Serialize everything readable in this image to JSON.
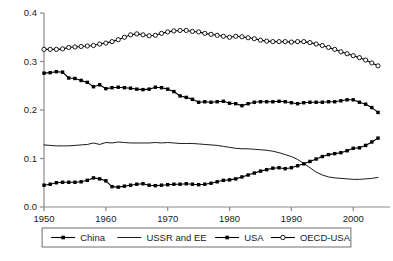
{
  "chart_data": {
    "type": "line",
    "title": "",
    "xlabel": "",
    "ylabel": "",
    "xlim": [
      1950,
      2004
    ],
    "ylim": [
      0.0,
      0.4
    ],
    "grid": false,
    "legend_position": "bottom",
    "yticks": [
      "0.0",
      "0.1",
      "0.2",
      "0.3",
      "0.4"
    ],
    "ytick_values": [
      0.0,
      0.1,
      0.2,
      0.3,
      0.4
    ],
    "xticks": [
      "1950",
      "1960",
      "1970",
      "1980",
      "1990",
      "2000"
    ],
    "xtick_values": [
      1950,
      1960,
      1970,
      1980,
      1990,
      2000
    ],
    "x": [
      1950,
      1951,
      1952,
      1953,
      1954,
      1955,
      1956,
      1957,
      1958,
      1959,
      1960,
      1961,
      1962,
      1963,
      1964,
      1965,
      1966,
      1967,
      1968,
      1969,
      1970,
      1971,
      1972,
      1973,
      1974,
      1975,
      1976,
      1977,
      1978,
      1979,
      1980,
      1981,
      1982,
      1983,
      1984,
      1985,
      1986,
      1987,
      1988,
      1989,
      1990,
      1991,
      1992,
      1993,
      1994,
      1995,
      1996,
      1997,
      1998,
      1999,
      2000,
      2001,
      2002,
      2003,
      2004
    ],
    "series": [
      {
        "name": "China",
        "marker": "filled-square",
        "line": "solid",
        "color": "#000000",
        "values": [
          0.045,
          0.047,
          0.05,
          0.051,
          0.051,
          0.051,
          0.052,
          0.055,
          0.06,
          0.058,
          0.054,
          0.042,
          0.041,
          0.043,
          0.045,
          0.047,
          0.048,
          0.045,
          0.044,
          0.045,
          0.046,
          0.047,
          0.047,
          0.048,
          0.047,
          0.046,
          0.047,
          0.049,
          0.052,
          0.055,
          0.056,
          0.058,
          0.062,
          0.066,
          0.07,
          0.074,
          0.077,
          0.08,
          0.081,
          0.079,
          0.081,
          0.085,
          0.089,
          0.094,
          0.099,
          0.104,
          0.108,
          0.11,
          0.112,
          0.116,
          0.121,
          0.122,
          0.127,
          0.134,
          0.142
        ]
      },
      {
        "name": "USSR and EE",
        "marker": "none",
        "line": "solid",
        "color": "#000000",
        "values": [
          0.128,
          0.127,
          0.126,
          0.126,
          0.126,
          0.127,
          0.128,
          0.129,
          0.132,
          0.129,
          0.133,
          0.132,
          0.134,
          0.133,
          0.132,
          0.132,
          0.132,
          0.132,
          0.133,
          0.132,
          0.133,
          0.132,
          0.131,
          0.131,
          0.131,
          0.13,
          0.129,
          0.128,
          0.127,
          0.125,
          0.123,
          0.121,
          0.12,
          0.12,
          0.119,
          0.118,
          0.117,
          0.115,
          0.112,
          0.108,
          0.104,
          0.098,
          0.09,
          0.081,
          0.072,
          0.066,
          0.062,
          0.06,
          0.059,
          0.058,
          0.057,
          0.057,
          0.058,
          0.059,
          0.061
        ]
      },
      {
        "name": "USA",
        "marker": "filled-square",
        "line": "solid",
        "color": "#000000",
        "values": [
          0.276,
          0.277,
          0.279,
          0.278,
          0.266,
          0.265,
          0.261,
          0.257,
          0.248,
          0.252,
          0.244,
          0.246,
          0.247,
          0.246,
          0.245,
          0.243,
          0.242,
          0.243,
          0.247,
          0.246,
          0.243,
          0.238,
          0.229,
          0.226,
          0.222,
          0.216,
          0.217,
          0.216,
          0.217,
          0.218,
          0.214,
          0.213,
          0.209,
          0.213,
          0.216,
          0.217,
          0.217,
          0.217,
          0.218,
          0.217,
          0.215,
          0.213,
          0.215,
          0.216,
          0.216,
          0.216,
          0.217,
          0.217,
          0.219,
          0.221,
          0.221,
          0.216,
          0.212,
          0.205,
          0.195
        ]
      },
      {
        "name": "OECD-USA",
        "marker": "open-circle",
        "line": "solid",
        "color": "#000000",
        "values": [
          0.325,
          0.325,
          0.325,
          0.326,
          0.329,
          0.33,
          0.331,
          0.332,
          0.333,
          0.336,
          0.338,
          0.341,
          0.345,
          0.35,
          0.355,
          0.357,
          0.355,
          0.353,
          0.354,
          0.358,
          0.361,
          0.363,
          0.364,
          0.364,
          0.362,
          0.361,
          0.358,
          0.356,
          0.354,
          0.352,
          0.35,
          0.352,
          0.351,
          0.349,
          0.347,
          0.344,
          0.342,
          0.341,
          0.341,
          0.341,
          0.34,
          0.341,
          0.341,
          0.339,
          0.336,
          0.333,
          0.329,
          0.325,
          0.32,
          0.316,
          0.312,
          0.308,
          0.303,
          0.297,
          0.291
        ]
      }
    ]
  },
  "legend": {
    "items": [
      {
        "label": "China",
        "marker": "filled-square"
      },
      {
        "label": "USSR and EE",
        "marker": "none"
      },
      {
        "label": "USA",
        "marker": "filled-square"
      },
      {
        "label": "OECD-USA",
        "marker": "open-circle"
      }
    ]
  }
}
